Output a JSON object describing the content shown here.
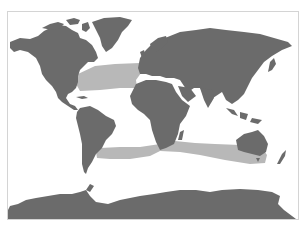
{
  "map": {
    "type": "world-map",
    "projection": "equirectangular-like",
    "colors": {
      "background": "#ffffff",
      "frame": "#d4d4d4",
      "land": "#6b6b6b",
      "range_band": "#b8b8b8"
    },
    "highlighted_regions": [
      {
        "name": "north-atlantic-band",
        "description": "Band across North Atlantic from eastern North America to western Europe/Iberia"
      },
      {
        "name": "southern-ocean-band",
        "description": "Band across southern hemisphere from southern South America past southern Africa to southern Australia"
      }
    ],
    "continents": [
      "North America",
      "Greenland",
      "South America",
      "Europe",
      "Asia",
      "Africa",
      "Australia",
      "New Zealand",
      "Antarctica"
    ]
  }
}
